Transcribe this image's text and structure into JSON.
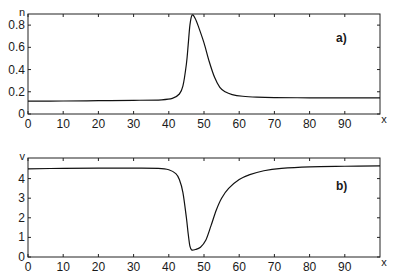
{
  "chart_data": [
    {
      "type": "line",
      "panel_label": "a)",
      "title": "",
      "xlabel": "x",
      "ylabel": "n",
      "xlim": [
        0,
        100
      ],
      "ylim": [
        0,
        0.9
      ],
      "x_ticks": [
        0,
        10,
        20,
        30,
        40,
        50,
        60,
        70,
        80,
        90
      ],
      "y_ticks": [
        0,
        0.2,
        0.4,
        0.6,
        0.8
      ],
      "y_tick_labels": [
        "0",
        "0.2",
        "0.4",
        "0.6",
        "0.8"
      ],
      "grid": false,
      "series": [
        {
          "name": "n",
          "x": [
            0,
            10,
            20,
            30,
            38,
            41,
            43,
            44,
            45,
            45.5,
            46,
            46.6,
            47.5,
            48.5,
            50,
            51.5,
            53,
            54.5,
            56,
            58,
            61,
            65,
            70,
            80,
            90,
            100
          ],
          "y": [
            0.115,
            0.117,
            0.12,
            0.123,
            0.128,
            0.14,
            0.18,
            0.25,
            0.45,
            0.62,
            0.8,
            0.89,
            0.86,
            0.78,
            0.64,
            0.47,
            0.33,
            0.24,
            0.2,
            0.175,
            0.16,
            0.152,
            0.148,
            0.146,
            0.146,
            0.146
          ]
        }
      ]
    },
    {
      "type": "line",
      "panel_label": "b)",
      "title": "",
      "xlabel": "x",
      "ylabel": "v",
      "xlim": [
        0,
        100
      ],
      "ylim": [
        0,
        5.05
      ],
      "x_ticks": [
        0,
        10,
        20,
        30,
        40,
        50,
        60,
        70,
        80,
        90
      ],
      "y_ticks": [
        0,
        1,
        2,
        3,
        4
      ],
      "y_tick_labels": [
        "0",
        "1",
        "2",
        "3",
        "4"
      ],
      "grid": false,
      "series": [
        {
          "name": "v",
          "x": [
            0,
            10,
            20,
            30,
            37,
            40,
            42,
            43,
            44,
            45,
            45.5,
            46,
            46.5,
            47.5,
            49,
            50.5,
            52,
            53.5,
            55,
            57,
            60,
            63,
            67,
            72,
            80,
            90,
            100
          ],
          "y": [
            4.5,
            4.52,
            4.53,
            4.53,
            4.52,
            4.45,
            4.25,
            3.95,
            3.3,
            2.0,
            1.2,
            0.55,
            0.36,
            0.38,
            0.5,
            0.85,
            1.6,
            2.4,
            3.0,
            3.5,
            3.95,
            4.2,
            4.4,
            4.52,
            4.6,
            4.63,
            4.65
          ]
        }
      ]
    }
  ]
}
